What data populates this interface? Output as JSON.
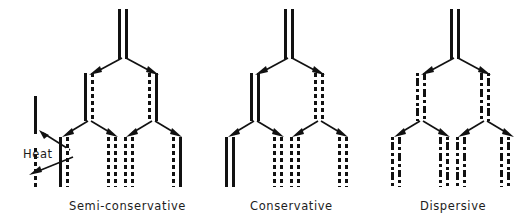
{
  "figure": {
    "caption_labels": [
      "Semi-conservative",
      "Conservative",
      "Dispersive"
    ],
    "annotation": "Heat",
    "ink_color": "#111111",
    "background_color": "#ffffff"
  },
  "legend": {
    "heat_label": "Heat",
    "solid_strand_name": "solid-line-strand",
    "dashed_strand_name": "dashed-line-strand"
  },
  "models": [
    {
      "name": "Semi-conservative",
      "label": "Semi-conservative",
      "generations": [
        {
          "gen": 0,
          "duplexes": [
            {
              "strands": [
                "solid",
                "solid"
              ]
            }
          ]
        },
        {
          "gen": 1,
          "duplexes": [
            {
              "strands": [
                "solid",
                "dashed"
              ]
            },
            {
              "strands": [
                "dashed",
                "solid"
              ]
            }
          ]
        },
        {
          "gen": 2,
          "duplexes": [
            {
              "strands": [
                "solid",
                "dashed"
              ]
            },
            {
              "strands": [
                "dashed",
                "dashed"
              ]
            },
            {
              "strands": [
                "dashed",
                "dashed"
              ]
            },
            {
              "strands": [
                "dashed",
                "solid"
              ]
            }
          ]
        }
      ]
    },
    {
      "name": "Conservative",
      "label": "Conservative",
      "generations": [
        {
          "gen": 0,
          "duplexes": [
            {
              "strands": [
                "solid",
                "solid"
              ]
            }
          ]
        },
        {
          "gen": 1,
          "duplexes": [
            {
              "strands": [
                "solid",
                "solid"
              ]
            },
            {
              "strands": [
                "dashed",
                "dashed"
              ]
            }
          ]
        },
        {
          "gen": 2,
          "duplexes": [
            {
              "strands": [
                "solid",
                "solid"
              ]
            },
            {
              "strands": [
                "dashed",
                "dashed"
              ]
            },
            {
              "strands": [
                "dashed",
                "dashed"
              ]
            },
            {
              "strands": [
                "dashed",
                "dashed"
              ]
            }
          ]
        }
      ]
    },
    {
      "name": "Dispersive",
      "label": "Dispersive",
      "generations": [
        {
          "gen": 0,
          "duplexes": [
            {
              "strands": [
                "solid",
                "solid"
              ]
            }
          ]
        },
        {
          "gen": 1,
          "duplexes": [
            {
              "strands": [
                "mixed",
                "mixed"
              ]
            },
            {
              "strands": [
                "mixed",
                "mixed"
              ]
            }
          ]
        },
        {
          "gen": 2,
          "duplexes": [
            {
              "strands": [
                "mixed",
                "mixed"
              ]
            },
            {
              "strands": [
                "mixed",
                "mixed"
              ]
            },
            {
              "strands": [
                "mixed",
                "mixed"
              ]
            },
            {
              "strands": [
                "mixed",
                "mixed"
              ]
            }
          ]
        }
      ]
    }
  ]
}
